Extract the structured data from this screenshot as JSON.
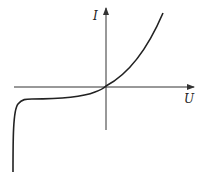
{
  "diagram": {
    "type": "diode I-V characteristic",
    "axes": {
      "x_label": "U",
      "y_label": "I"
    },
    "colors": {
      "curve": "#222222",
      "axes": "#333333",
      "background": "#ffffff"
    }
  }
}
